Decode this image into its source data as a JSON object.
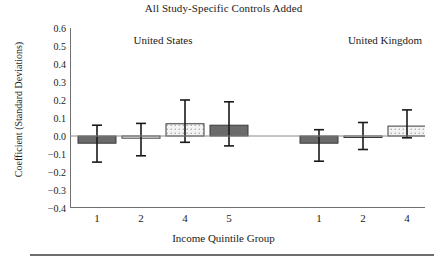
{
  "chart_data": {
    "type": "bar",
    "title": "All Study-Specific Controls Added",
    "xlabel": "Income Quintile Group",
    "ylabel": "Coefficient (Standard Deviations)",
    "ylim": [
      -0.4,
      0.6
    ],
    "yticks": [
      "0.6",
      "0.5",
      "0.4",
      "0.3",
      "0.2",
      "0.1",
      "0.0",
      "-0.1",
      "-0.2",
      "-0.3",
      "-0.4"
    ],
    "ytick_values": [
      0.6,
      0.5,
      0.4,
      0.3,
      0.2,
      0.1,
      0.0,
      -0.1,
      -0.2,
      -0.3,
      -0.4
    ],
    "grid": false,
    "legend": "none",
    "group_labels": [
      "United States",
      "United Kingdom"
    ],
    "categories": [
      "1",
      "2",
      "4",
      "5",
      "1",
      "2",
      "4",
      "5"
    ],
    "groups": [
      {
        "name": "United States",
        "bars": [
          {
            "category": "1",
            "value": -0.04,
            "ci_low": -0.145,
            "ci_high": 0.06,
            "fill": "dark"
          },
          {
            "category": "2",
            "value": -0.012,
            "ci_low": -0.11,
            "ci_high": 0.07,
            "fill": "white"
          },
          {
            "category": "4",
            "value": 0.068,
            "ci_low": -0.035,
            "ci_high": 0.2,
            "fill": "dotted"
          },
          {
            "category": "5",
            "value": 0.06,
            "ci_low": -0.055,
            "ci_high": 0.19,
            "fill": "dark"
          }
        ]
      },
      {
        "name": "United Kingdom",
        "bars": [
          {
            "category": "1",
            "value": -0.04,
            "ci_low": -0.14,
            "ci_high": 0.035,
            "fill": "dark"
          },
          {
            "category": "2",
            "value": -0.002,
            "ci_low": -0.075,
            "ci_high": 0.075,
            "fill": "white"
          },
          {
            "category": "4",
            "value": 0.055,
            "ci_low": -0.01,
            "ci_high": 0.145,
            "fill": "dotted"
          },
          {
            "category": "5",
            "value": 0.015,
            "ci_low": -0.055,
            "ci_high": 0.085,
            "fill": "dark"
          }
        ]
      }
    ],
    "colors": {
      "dark_fill": "#6b6b6b",
      "white_fill": "#ffffff",
      "dotted_fill": "#f2f2f2",
      "dot_color": "#9a9a9a",
      "edge": "#3a3a3a",
      "axis": "#707070",
      "error_bar": "#1a1a1a"
    }
  }
}
